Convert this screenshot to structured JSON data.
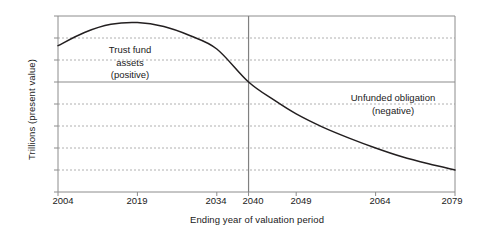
{
  "chart_data": {
    "type": "line",
    "title": "",
    "xlabel": "Ending year of valuation period",
    "ylabel": "Trillions (present value)",
    "xlim": [
      2004,
      2079
    ],
    "ylim": [
      -5,
      3
    ],
    "grid": true,
    "legend": "none",
    "xticks": [
      2004,
      2019,
      2034,
      2040,
      2049,
      2064,
      2079
    ],
    "xticklabels": [
      "2004",
      "2019",
      "2034",
      "2040",
      "2049",
      "2064",
      "2079"
    ],
    "yticks": [
      3,
      2,
      1,
      0,
      -1,
      -2,
      -3,
      -4,
      -5
    ],
    "yticklabels": [
      "$3",
      "$2",
      "$1",
      "$0",
      "-$1",
      "-$2",
      "-$3",
      "-$4",
      "-$5"
    ],
    "series": [
      {
        "name": "Trust fund balance (present value)",
        "color": "#231f20",
        "x": [
          2004,
          2009,
          2014,
          2019,
          2024,
          2029,
          2034,
          2040,
          2045,
          2049,
          2054,
          2059,
          2064,
          2069,
          2074,
          2079
        ],
        "y": [
          1.65,
          2.25,
          2.62,
          2.7,
          2.52,
          2.1,
          1.5,
          0.0,
          -0.85,
          -1.45,
          -2.05,
          -2.55,
          -3.0,
          -3.4,
          -3.72,
          -4.0
        ]
      }
    ],
    "annotations": [
      {
        "name": "trust-fund-assets",
        "lines": [
          "Trust fund",
          "assets",
          "(positive)"
        ],
        "x": 2016,
        "y": 1.2
      },
      {
        "name": "unfunded-obligation",
        "lines": [
          "Unfunded obligation",
          "(negative)"
        ],
        "x": 2060,
        "y": -0.55
      }
    ],
    "vertical_reference_line": {
      "name": "year-2040-marker",
      "x": 2040,
      "color": "#808080"
    },
    "axis_colors": {
      "frame": "#8c8c8c",
      "gridline": "#b0b0b0",
      "zero_line": "#8c8c8c",
      "curve": "#231f20"
    }
  }
}
